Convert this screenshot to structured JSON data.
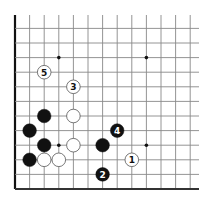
{
  "diagram": {
    "type": "go-board-partial",
    "grid": {
      "columns": 13,
      "rows": 12,
      "origin_x": 15,
      "bottom_y": 189,
      "spacing": 14.6,
      "top_line_start_y": 15,
      "right_line_end_x": 199,
      "edges": {
        "left": "board-edge",
        "bottom": "board-edge",
        "top": "open",
        "right": "open"
      },
      "line_color": "#888888",
      "edge_color": "#333333"
    },
    "hoshi": [
      {
        "col": 4,
        "row": 10
      },
      {
        "col": 10,
        "row": 10
      },
      {
        "col": 4,
        "row": 4
      },
      {
        "col": 10,
        "row": 4
      }
    ],
    "stones": [
      {
        "color": "black",
        "col": 3,
        "row": 6,
        "label": ""
      },
      {
        "color": "white",
        "col": 5,
        "row": 6,
        "label": ""
      },
      {
        "color": "black",
        "col": 2,
        "row": 5,
        "label": ""
      },
      {
        "color": "black",
        "col": 3,
        "row": 4,
        "label": ""
      },
      {
        "color": "white",
        "col": 5,
        "row": 4,
        "label": ""
      },
      {
        "color": "black",
        "col": 7,
        "row": 4,
        "label": ""
      },
      {
        "color": "black",
        "col": 2,
        "row": 3,
        "label": ""
      },
      {
        "color": "white",
        "col": 3,
        "row": 3,
        "label": ""
      },
      {
        "color": "white",
        "col": 4,
        "row": 3,
        "label": ""
      },
      {
        "color": "white",
        "col": 9,
        "row": 3,
        "label": "1"
      },
      {
        "color": "black",
        "col": 7,
        "row": 2,
        "label": "2"
      },
      {
        "color": "white",
        "col": 5,
        "row": 8,
        "label": "3"
      },
      {
        "color": "black",
        "col": 8,
        "row": 5,
        "label": "4"
      },
      {
        "color": "white",
        "col": 3,
        "row": 9,
        "label": "5"
      }
    ],
    "colors": {
      "black_stone": "#111111",
      "white_stone_fill": "#ffffff",
      "white_stone_border": "#555555",
      "hoshi": "#111111"
    }
  }
}
